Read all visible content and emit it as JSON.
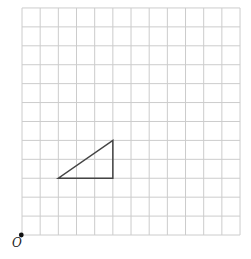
{
  "diagram": {
    "type": "grid-with-shape",
    "grid": {
      "columns": 12,
      "rows": 12,
      "origin_px": [
        22,
        235
      ],
      "cell_w": 18.17,
      "cell_h": 18.92,
      "line_color": "#cccccc"
    },
    "origin": {
      "label": "O",
      "point": [
        0,
        0
      ],
      "dot_color": "#111111"
    },
    "shapes": [
      {
        "name": "triangle",
        "vertices": [
          [
            2,
            3
          ],
          [
            5,
            3
          ],
          [
            5,
            5
          ]
        ],
        "stroke": "#444444",
        "stroke_width": 1.5
      }
    ]
  }
}
